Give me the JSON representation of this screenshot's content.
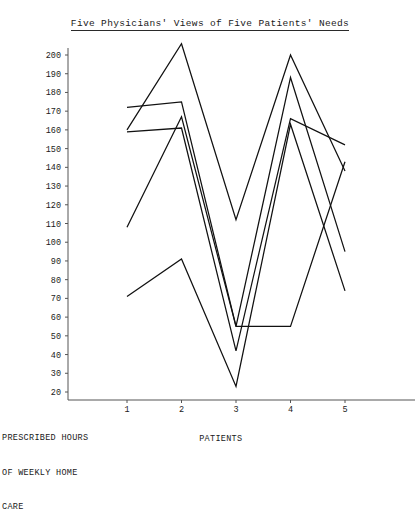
{
  "chart_data": {
    "type": "line",
    "title": "Five Physicians' Views of Five Patients' Needs",
    "xlabel": "PATIENTS",
    "ylabel": "PRESCRIBED HOURS\nOF WEEKLY HOME\nCARE",
    "categories": [
      "1",
      "2",
      "3",
      "4",
      "5"
    ],
    "x": [
      1,
      2,
      3,
      4,
      5
    ],
    "xlim": [
      0.55,
      5.45
    ],
    "ylim": [
      20,
      200
    ],
    "ytick_step": 10,
    "yticks": [
      200,
      190,
      180,
      170,
      160,
      150,
      140,
      130,
      120,
      110,
      100,
      90,
      80,
      70,
      60,
      50,
      40,
      30,
      20
    ],
    "grid": false,
    "legend": "none",
    "series": [
      {
        "name": "Physician 1",
        "values": [
          160,
          206,
          112,
          200,
          138
        ]
      },
      {
        "name": "Physician 2",
        "values": [
          172,
          175,
          55,
          188,
          95
        ]
      },
      {
        "name": "Physician 3",
        "values": [
          159,
          161,
          42,
          166,
          152
        ]
      },
      {
        "name": "Physician 4",
        "values": [
          108,
          167,
          55,
          55,
          143
        ]
      },
      {
        "name": "Physician 5",
        "values": [
          71,
          91,
          23,
          163,
          74
        ]
      }
    ]
  },
  "axes": {
    "y_caption_line1": "PRESCRIBED HOURS",
    "y_caption_line2": "OF WEEKLY HOME",
    "y_caption_line3": "CARE",
    "x_caption": "PATIENTS"
  }
}
